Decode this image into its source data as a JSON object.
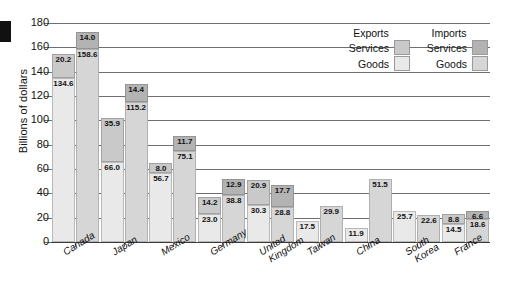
{
  "chart_data": {
    "type": "bar",
    "subtype": "grouped-stacked",
    "title": "",
    "xlabel": "",
    "ylabel": "Billions of dollars",
    "ylim": [
      0,
      180
    ],
    "ytick_step": 20,
    "yticks": [
      "180",
      "160",
      "140",
      "120",
      "100",
      "80",
      "60",
      "40",
      "20",
      "0"
    ],
    "grid": true,
    "legend": {
      "position": "top-right",
      "columns": [
        {
          "header": "Exports",
          "entries": [
            {
              "label": "Services",
              "swatch": "serv-exp",
              "color": "#c9c9c9"
            },
            {
              "label": "Goods",
              "swatch": "goods-exp",
              "color": "#e9e9e9"
            }
          ]
        },
        {
          "header": "Imports",
          "entries": [
            {
              "label": "Services",
              "swatch": "serv-imp",
              "color": "#b3b3b3"
            },
            {
              "label": "Goods",
              "swatch": "goods-imp",
              "color": "#d6d6d6"
            }
          ]
        }
      ]
    },
    "categories": [
      "Canada",
      "Japan",
      "Mexico",
      "Germany",
      "United Kingdom",
      "Taiwan",
      "China",
      "South Korea",
      "France"
    ],
    "category_lines": [
      [
        "Canada"
      ],
      [
        "Japan"
      ],
      [
        "Mexico"
      ],
      [
        "Germany"
      ],
      [
        "United",
        "Kingdom"
      ],
      [
        "Taiwan"
      ],
      [
        "China"
      ],
      [
        "South",
        "Korea"
      ],
      [
        "France"
      ]
    ],
    "series": [
      {
        "name": "Exports Goods",
        "values": [
          134.6,
          66.0,
          56.7,
          23.0,
          30.3,
          null,
          11.9,
          25.7,
          14.5
        ]
      },
      {
        "name": "Exports Services",
        "values": [
          20.2,
          35.9,
          8.0,
          14.2,
          20.9,
          17.5,
          null,
          null,
          8.8
        ]
      },
      {
        "name": "Imports Goods",
        "values": [
          158.6,
          115.2,
          75.1,
          38.8,
          28.8,
          29.9,
          51.5,
          22.6,
          18.6
        ]
      },
      {
        "name": "Imports Services",
        "values": [
          14.0,
          14.4,
          11.7,
          12.9,
          17.7,
          null,
          null,
          null,
          6.6
        ]
      }
    ],
    "bars": [
      {
        "category": "Canada",
        "exports": {
          "goods": 134.6,
          "services": 20.2
        },
        "imports": {
          "goods": 158.6,
          "services": 14.0
        }
      },
      {
        "category": "Japan",
        "exports": {
          "goods": 66.0,
          "services": 35.9
        },
        "imports": {
          "goods": 115.2,
          "services": 14.4
        }
      },
      {
        "category": "Mexico",
        "exports": {
          "goods": 56.7,
          "services": 8.0
        },
        "imports": {
          "goods": 75.1,
          "services": 11.7
        }
      },
      {
        "category": "Germany",
        "exports": {
          "goods": 23.0,
          "services": 14.2
        },
        "imports": {
          "goods": 38.8,
          "services": 12.9
        }
      },
      {
        "category": "United Kingdom",
        "exports": {
          "goods": 30.3,
          "services": 20.9
        },
        "imports": {
          "goods": 28.8,
          "services": 17.7
        }
      },
      {
        "category": "Taiwan",
        "exports": {
          "goods": 17.5,
          "services": null
        },
        "imports": {
          "goods": 29.9,
          "services": null
        }
      },
      {
        "category": "China",
        "exports": {
          "goods": 11.9,
          "services": null
        },
        "imports": {
          "goods": 51.5,
          "services": null
        }
      },
      {
        "category": "South Korea",
        "exports": {
          "goods": 25.7,
          "services": null
        },
        "imports": {
          "goods": 22.6,
          "services": null
        }
      },
      {
        "category": "France",
        "exports": {
          "goods": 14.5,
          "services": 8.8
        },
        "imports": {
          "goods": 18.6,
          "services": 6.6
        }
      }
    ]
  }
}
